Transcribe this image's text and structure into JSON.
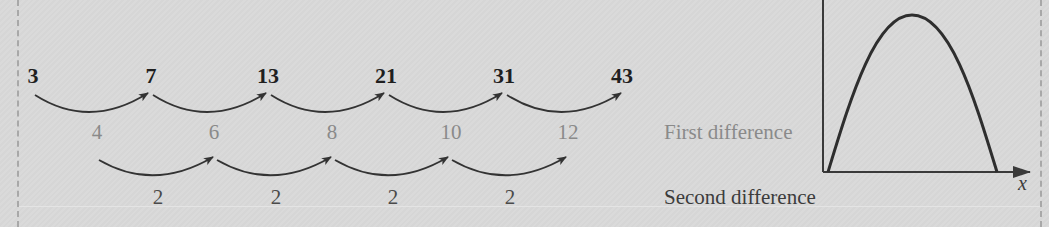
{
  "sequence": {
    "terms": [
      "3",
      "7",
      "13",
      "21",
      "31",
      "43"
    ],
    "first_differences": [
      "4",
      "6",
      "8",
      "10",
      "12"
    ],
    "second_differences": [
      "2",
      "2",
      "2",
      "2"
    ]
  },
  "labels": {
    "first_difference": "First difference",
    "second_difference": "Second difference"
  },
  "graph": {
    "x_axis_label": "x",
    "curve": "downward parabola",
    "colors": {
      "axis": "#3a3a3a",
      "curve": "#2e2e2e"
    }
  },
  "colors": {
    "background": "#d9d9d9",
    "term_text": "#1f1f1f",
    "first_difference_text": "#8a8a8a",
    "second_difference_text": "#4a4a4a",
    "arrow": "#333333"
  }
}
